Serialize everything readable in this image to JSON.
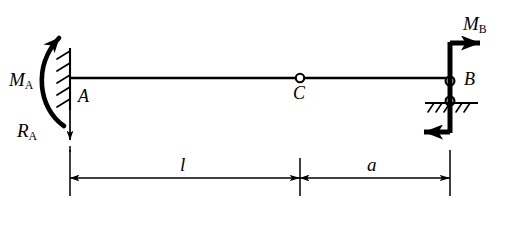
{
  "figure": {
    "type": "structural-beam-free-body-diagram",
    "labels": {
      "moment_a": {
        "symbol": "M",
        "subscript": "A",
        "full": "MA"
      },
      "reaction_a": {
        "symbol": "R",
        "subscript": "A",
        "full": "RA"
      },
      "moment_b": {
        "symbol": "M",
        "subscript": "B",
        "full": "MB"
      },
      "node_a": "A",
      "node_b": "B",
      "node_c": "C",
      "dim_left": "l",
      "dim_right": "a"
    },
    "colors": {
      "ink": "#000000",
      "background": "#ffffff"
    },
    "geometry": {
      "beam_y": 78,
      "support_a_x": 70,
      "hinge_c_x": 300,
      "support_b_x": 450,
      "ground_b_y": 103,
      "dimension_line_y": 178,
      "span_l": "70 to 300",
      "span_a": "300 to 450"
    },
    "elements": [
      {
        "name": "fixed-support-a",
        "kind": "fixed-support",
        "at": "A"
      },
      {
        "name": "applied-moment-a",
        "kind": "curved-moment-arrow",
        "sense": "counterclockwise",
        "at": "A"
      },
      {
        "name": "reaction-force-a",
        "kind": "force-arrow",
        "direction": "down",
        "at": "A"
      },
      {
        "name": "beam-member",
        "kind": "beam",
        "from": "A",
        "to": "B"
      },
      {
        "name": "internal-hinge-c",
        "kind": "hinge",
        "at": "C"
      },
      {
        "name": "pin-support-b",
        "kind": "pin-on-ground",
        "at": "B"
      },
      {
        "name": "applied-moment-b",
        "kind": "force-couple",
        "sense": "clockwise",
        "at": "B"
      },
      {
        "name": "dimension-l",
        "kind": "dimension",
        "label": "l"
      },
      {
        "name": "dimension-a",
        "kind": "dimension",
        "label": "a"
      }
    ]
  }
}
